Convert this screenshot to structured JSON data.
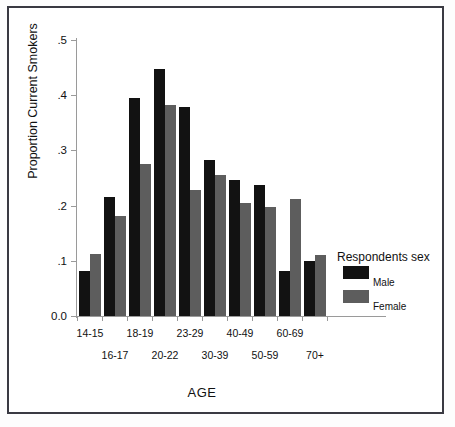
{
  "chart_data": {
    "type": "bar",
    "title": "",
    "xlabel": "AGE",
    "ylabel": "Proportion Current Smokers",
    "categories": [
      "14-15",
      "16-17",
      "18-19",
      "20-22",
      "23-29",
      "30-39",
      "40-49",
      "50-59",
      "60-69",
      "70+"
    ],
    "series": [
      {
        "name": "Male",
        "color": "#121212",
        "values": [
          0.082,
          0.215,
          0.395,
          0.448,
          0.378,
          0.283,
          0.247,
          0.237,
          0.082,
          0.1
        ]
      },
      {
        "name": "Female",
        "color": "#5d5d5d",
        "values": [
          0.112,
          0.182,
          0.275,
          0.383,
          0.228,
          0.255,
          0.205,
          0.197,
          0.212,
          0.11
        ]
      }
    ],
    "ylim": [
      0.0,
      0.5
    ],
    "yticks": [
      0.0,
      0.1,
      0.2,
      0.3,
      0.4,
      0.5
    ],
    "ytick_labels": [
      "0.0",
      ".1",
      ".2",
      ".3",
      ".4",
      ".5"
    ],
    "grid": false,
    "legend": {
      "title": "Respondents sex",
      "position": "right",
      "entries": [
        {
          "label": "Male",
          "color": "#121212"
        },
        {
          "label": "Female",
          "color": "#5d5d5d"
        }
      ]
    }
  }
}
